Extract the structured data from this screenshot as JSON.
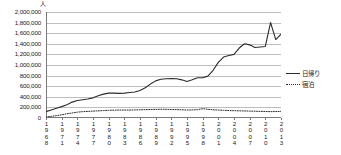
{
  "chart": {
    "unit_label": "人",
    "legend": [
      {
        "name": "日帰り",
        "style": "solid"
      },
      {
        "name": "宿泊",
        "style": "dotted"
      }
    ]
  },
  "chart_data": {
    "type": "line",
    "title": "",
    "subtitle": "",
    "xlabel": "",
    "ylabel": "人",
    "ylim": [
      0,
      2000000
    ],
    "ytick_step": 200000,
    "ytick_labels": [
      "2,000,000",
      "1,800,000",
      "1,600,000",
      "1,400,000",
      "1,200,000",
      "1,000,000",
      "800,000",
      "600,000",
      "400,000",
      "200,000",
      "0"
    ],
    "grid": true,
    "legend_position": "right",
    "x": [
      1968,
      1969,
      1970,
      1971,
      1972,
      1973,
      1974,
      1975,
      1976,
      1977,
      1978,
      1979,
      1980,
      1981,
      1982,
      1983,
      1984,
      1985,
      1986,
      1987,
      1988,
      1989,
      1990,
      1991,
      1992,
      1993,
      1994,
      1995,
      1996,
      1997,
      1998,
      1999,
      2000,
      2001,
      2002,
      2003,
      2004,
      2005,
      2006,
      2007,
      2008,
      2009,
      2010,
      2011,
      2012,
      2013
    ],
    "xtick_labels": [
      "1968",
      "1971",
      "1974",
      "1977",
      "1980",
      "1983",
      "1986",
      "1989",
      "1992",
      "1995",
      "1998",
      "2001",
      "2004",
      "2007",
      "2010",
      "2013"
    ],
    "series": [
      {
        "name": "日帰り",
        "style": "solid",
        "values": [
          120000,
          150000,
          185000,
          215000,
          250000,
          300000,
          330000,
          345000,
          360000,
          380000,
          420000,
          450000,
          470000,
          470000,
          465000,
          470000,
          480000,
          490000,
          520000,
          570000,
          640000,
          700000,
          730000,
          740000,
          745000,
          740000,
          720000,
          690000,
          720000,
          760000,
          760000,
          790000,
          900000,
          1050000,
          1150000,
          1180000,
          1200000,
          1320000,
          1400000,
          1380000,
          1330000,
          1340000,
          1350000,
          1800000,
          1480000,
          1580000
        ]
      },
      {
        "name": "宿泊",
        "style": "dotted",
        "values": [
          20000,
          30000,
          45000,
          60000,
          80000,
          95000,
          110000,
          120000,
          125000,
          130000,
          135000,
          140000,
          145000,
          148000,
          150000,
          150000,
          150000,
          152000,
          155000,
          158000,
          160000,
          162000,
          165000,
          163000,
          160000,
          158000,
          155000,
          150000,
          152000,
          158000,
          175000,
          165000,
          155000,
          150000,
          145000,
          140000,
          138000,
          135000,
          133000,
          130000,
          128000,
          125000,
          123000,
          120000,
          122000,
          125000
        ]
      }
    ]
  }
}
